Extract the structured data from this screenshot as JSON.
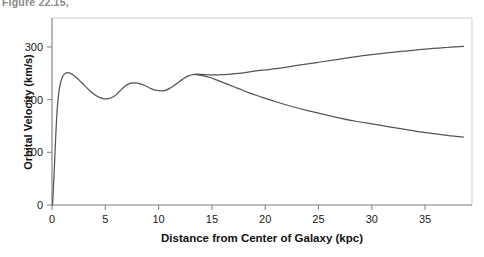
{
  "caption_fragment": "Figure 22.15,",
  "chart_data": {
    "type": "line",
    "title": "",
    "xlabel": "Distance from Center of Galaxy (kpc)",
    "ylabel": "Orbital Velocity (km/s)",
    "xlim": [
      0,
      39.4
    ],
    "ylim": [
      0,
      355
    ],
    "grid": false,
    "legend": "none",
    "xticks": [
      0,
      5,
      10,
      15,
      20,
      25,
      30,
      35
    ],
    "xtick_labels": [
      "0",
      "5",
      "10",
      "15",
      "20",
      "25",
      "30",
      "35"
    ],
    "yticks": [
      0,
      100,
      200,
      300
    ],
    "ytick_labels": [
      "0",
      "100",
      "200",
      "300"
    ],
    "line_color": "#555555",
    "axis_color": "#888888",
    "series": [
      {
        "name": "observed-rotation-curve",
        "color": "#555555",
        "points": [
          [
            0.05,
            0
          ],
          [
            0.2,
            60
          ],
          [
            0.35,
            130
          ],
          [
            0.5,
            185
          ],
          [
            0.7,
            222
          ],
          [
            0.95,
            242
          ],
          [
            1.25,
            250
          ],
          [
            1.6,
            251
          ],
          [
            2.0,
            247
          ],
          [
            2.5,
            238
          ],
          [
            3.0,
            228
          ],
          [
            3.6,
            216
          ],
          [
            4.2,
            207
          ],
          [
            4.8,
            202
          ],
          [
            5.3,
            202
          ],
          [
            5.8,
            206
          ],
          [
            6.3,
            215
          ],
          [
            6.8,
            225
          ],
          [
            7.3,
            231
          ],
          [
            7.8,
            232
          ],
          [
            8.3,
            230
          ],
          [
            8.8,
            226
          ],
          [
            9.4,
            220
          ],
          [
            10.0,
            217
          ],
          [
            10.5,
            217
          ],
          [
            11.0,
            221
          ],
          [
            11.6,
            229
          ],
          [
            12.2,
            238
          ],
          [
            12.8,
            245
          ],
          [
            13.4,
            248
          ],
          [
            14.0,
            248
          ],
          [
            14.8,
            247
          ],
          [
            15.6,
            247
          ],
          [
            16.5,
            248
          ],
          [
            17.5,
            250
          ],
          [
            19.0,
            254
          ],
          [
            21.0,
            259
          ],
          [
            23.0,
            265
          ],
          [
            25.0,
            271
          ],
          [
            27.0,
            277
          ],
          [
            29.0,
            283
          ],
          [
            31.0,
            288
          ],
          [
            33.0,
            292
          ],
          [
            35.0,
            296
          ],
          [
            37.0,
            299
          ],
          [
            38.6,
            301
          ]
        ]
      },
      {
        "name": "keplerian-predicted-curve",
        "color": "#555555",
        "points": [
          [
            13.4,
            248
          ],
          [
            14.0,
            246
          ],
          [
            14.8,
            242
          ],
          [
            15.6,
            236
          ],
          [
            16.5,
            229
          ],
          [
            17.5,
            221
          ],
          [
            18.5,
            213
          ],
          [
            19.5,
            206
          ],
          [
            21.0,
            196
          ],
          [
            22.5,
            187
          ],
          [
            24.0,
            179
          ],
          [
            25.5,
            172
          ],
          [
            27.0,
            165
          ],
          [
            28.5,
            159
          ],
          [
            30.0,
            154
          ],
          [
            31.5,
            149
          ],
          [
            33.0,
            144
          ],
          [
            34.5,
            139
          ],
          [
            36.0,
            135
          ],
          [
            37.5,
            131
          ],
          [
            38.6,
            129
          ]
        ]
      }
    ]
  }
}
